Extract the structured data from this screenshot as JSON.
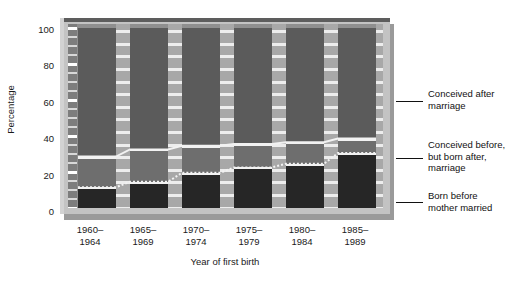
{
  "chart_data": {
    "type": "bar",
    "subtype": "stacked-percentage",
    "title": "",
    "xlabel": "Year of first birth",
    "ylabel": "Percentage",
    "ylim": [
      0,
      100
    ],
    "yticks": [
      0,
      20,
      40,
      60,
      80,
      100
    ],
    "ytick_labels": [
      "0",
      "20",
      "40",
      "60",
      "80",
      "100"
    ],
    "minor_ticks": true,
    "grid": false,
    "legend_position": "right-outside",
    "categories": [
      "1960–\n1964",
      "1965–\n1969",
      "1970–\n1974",
      "1975–\n1979",
      "1980–\n1984",
      "1985–\n1989"
    ],
    "category_labels": [
      {
        "line1": "1960–",
        "line2": "1964"
      },
      {
        "line1": "1965–",
        "line2": "1969"
      },
      {
        "line1": "1970–",
        "line2": "1974"
      },
      {
        "line1": "1975–",
        "line2": "1979"
      },
      {
        "line1": "1980–",
        "line2": "1984"
      },
      {
        "line1": "1985–",
        "line2": "1989"
      }
    ],
    "series": [
      {
        "name": "Born before mother married",
        "color": "#262626",
        "values": [
          11,
          14,
          19,
          22,
          24,
          30
        ]
      },
      {
        "name": "Conceived before, but born after, marriage",
        "color": "#6e6e6e",
        "values": [
          17,
          18,
          15,
          13,
          12,
          8
        ]
      },
      {
        "name": "Conceived after marriage",
        "color": "#5b5b5b",
        "values": [
          72,
          68,
          66,
          65,
          64,
          62
        ]
      }
    ],
    "cumulative_boundaries": [
      {
        "lower": 11,
        "upper": 28
      },
      {
        "lower": 14,
        "upper": 32
      },
      {
        "lower": 19,
        "upper": 34
      },
      {
        "lower": 22,
        "upper": 35
      },
      {
        "lower": 24,
        "upper": 36
      },
      {
        "lower": 30,
        "upper": 38
      }
    ]
  },
  "legend": {
    "items": [
      {
        "id": "conceived-after-marriage",
        "line1": "Conceived after",
        "line2": "marriage",
        "line3": ""
      },
      {
        "id": "conceived-before-born-after",
        "line1": "Conceived before,",
        "line2": "but born after,",
        "line3": "marriage"
      },
      {
        "id": "born-before-mother-married",
        "line1": "Born before",
        "line2": "mother married",
        "line3": ""
      }
    ]
  },
  "axes": {
    "y_title": "Percentage",
    "x_title": "Year of first birth",
    "y_labels": [
      "100",
      "80",
      "60",
      "40",
      "20",
      "0"
    ]
  },
  "colors": {
    "panel_bg": "#8f8f8f",
    "frame": "#c3c3c3",
    "frame_shadow": "#9a9a9a",
    "bevel_dark": "#5d5d5d",
    "gap": "#a8a8a8",
    "divider": "#f2f2f2",
    "segment_top": "#5b5b5b",
    "segment_mid": "#6e6e6e",
    "segment_bottom": "#262626",
    "text": "#1a1a1a"
  }
}
